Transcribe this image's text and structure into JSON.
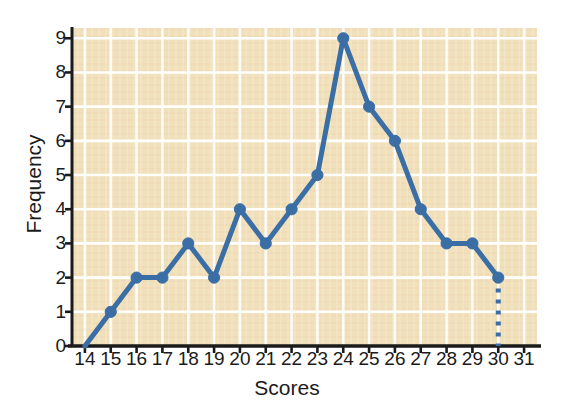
{
  "chart_data": {
    "type": "line",
    "title": "",
    "xlabel": "Scores",
    "ylabel": "Frequency",
    "x": [
      14,
      15,
      16,
      17,
      18,
      19,
      20,
      21,
      22,
      23,
      24,
      25,
      26,
      27,
      28,
      29,
      30
    ],
    "values": [
      0,
      1,
      2,
      2,
      3,
      2,
      4,
      3,
      4,
      5,
      9,
      7,
      6,
      4,
      3,
      3,
      2
    ],
    "xticks": [
      14,
      15,
      16,
      17,
      18,
      19,
      20,
      21,
      22,
      23,
      24,
      25,
      26,
      27,
      28,
      29,
      30,
      31
    ],
    "yticks": [
      0,
      1,
      2,
      3,
      4,
      5,
      6,
      7,
      8,
      9
    ],
    "xlim": [
      13.5,
      31.5
    ],
    "ylim": [
      0,
      9.3
    ],
    "grid": true,
    "legend": null,
    "markers": {
      "shown_at_x": [
        15,
        16,
        17,
        18,
        19,
        20,
        21,
        22,
        23,
        24,
        25,
        26,
        27,
        28,
        29,
        30
      ],
      "style": "filled-circle"
    },
    "annotations": [
      {
        "kind": "dotted-drop-line",
        "x": 30,
        "from_y": 2,
        "to_y": 0,
        "description": "dotted vertical line from the last data point down to the x-axis"
      }
    ],
    "colors": {
      "series": "#3a6ea5",
      "plot_background": "#f0dfba",
      "gridlines": "#ffffff",
      "axis": "#1b1b1b",
      "text": "#1b1b1b",
      "figure_background": "#ffffff"
    }
  }
}
